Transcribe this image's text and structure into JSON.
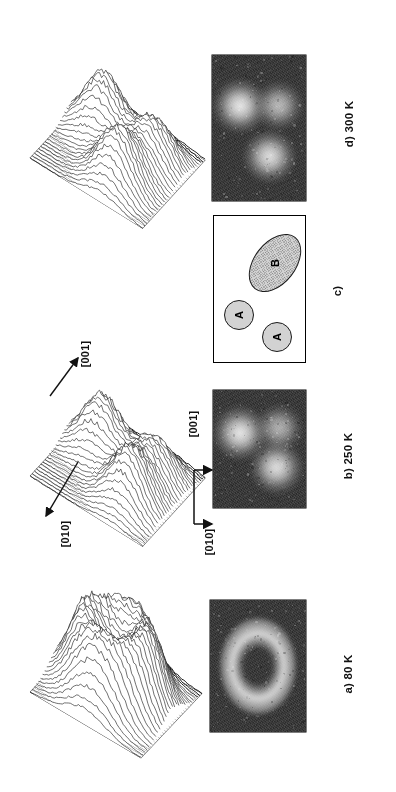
{
  "figure": {
    "kind": "leed-diffraction-figure",
    "panels": [
      {
        "id": "a",
        "label": "a)  80 K",
        "temperature": "80 K",
        "pattern": "diffuse-ring"
      },
      {
        "id": "b",
        "label": "b)  250 K",
        "temperature": "250 K",
        "pattern": "three-diffuse-spots"
      },
      {
        "id": "c",
        "label": "c)",
        "temperature": "",
        "pattern": "schematic"
      },
      {
        "id": "d",
        "label": "d)  300 K",
        "temperature": "300 K",
        "pattern": "three-diffuse-spots"
      }
    ],
    "panel_labels": {
      "a": "a)  80 K",
      "b": "b)  250 K",
      "c": "c)",
      "d": "d)  300 K"
    },
    "directions": {
      "vertical": "[001]",
      "horizontal": "[010]"
    },
    "schematic": {
      "features": [
        {
          "name": "A",
          "shape": "circle",
          "label": "A"
        },
        {
          "name": "B",
          "shape": "ellipse",
          "label": "B"
        },
        {
          "name": "A",
          "shape": "circle",
          "label": "A"
        }
      ]
    },
    "mesh_labels": {
      "b_up": "[001]",
      "b_down": "[010]"
    },
    "colors": {
      "ink": "#111111",
      "photo_background": "#2b2b2b",
      "blob_fill": "#d2d2d2",
      "blob_stroke": "#1a1a1a",
      "paper": "#ffffff"
    }
  },
  "chart_data": {
    "type": "surface",
    "xlabel": "[010]",
    "ylabel": "[001]",
    "zlabel": "Intensity",
    "series": [
      {
        "name": "a) 80 K",
        "temperature_K": 80,
        "description": "Broad ring (donut) of diffuse intensity, flat-topped crater profile",
        "peaks": [
          {
            "position": [
              -0.5,
              0.0
            ],
            "height": 0.85
          },
          {
            "position": [
              0.5,
              0.0
            ],
            "height": 0.85
          },
          {
            "position": [
              0.0,
              -0.5
            ],
            "height": 0.8
          },
          {
            "position": [
              0.0,
              0.5
            ],
            "height": 0.8
          }
        ],
        "central_minimum": 0.35
      },
      {
        "name": "b) 250 K",
        "temperature_K": 250,
        "description": "Two sharp resolved maxima with a saddle, split ring",
        "peaks": [
          {
            "position": [
              -0.45,
              0.3
            ],
            "height": 1.0
          },
          {
            "position": [
              0.4,
              -0.35
            ],
            "height": 0.95
          },
          {
            "position": [
              0.45,
              0.4
            ],
            "height": 0.7
          }
        ],
        "central_minimum": 0.2
      },
      {
        "name": "d) 300 K",
        "temperature_K": 300,
        "description": "Three well separated sharp maxima on a low diffuse background",
        "peaks": [
          {
            "position": [
              -0.45,
              0.35
            ],
            "height": 1.0
          },
          {
            "position": [
              0.45,
              0.35
            ],
            "height": 0.75
          },
          {
            "position": [
              0.25,
              -0.45
            ],
            "height": 0.95
          }
        ],
        "central_minimum": 0.15
      }
    ],
    "grid": false,
    "legend": "none"
  }
}
